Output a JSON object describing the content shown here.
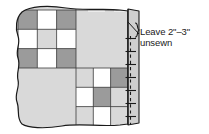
{
  "diagram": {
    "annotation": {
      "line1": "Leave 2\"–3\"",
      "line2": "unsewn",
      "brace": "}"
    },
    "colors": {
      "dark_patch": "#9b9b9b",
      "light_patch": "#d9d9d9",
      "white_patch": "#ffffff",
      "outline": "#1a1a1a",
      "seam_line": "#1a1a1a",
      "flap_fill": "#cfcfcf",
      "background": "#ffffff"
    },
    "quilt": {
      "description": "Alternating nine-patch blocks and plain blocks",
      "blocks": [
        {
          "name": "nine-patch-top-left",
          "type": "nine-patch",
          "cells": [
            "dark",
            "white",
            "dark",
            "white",
            "light",
            "white",
            "dark",
            "white",
            "dark"
          ]
        },
        {
          "name": "plain-top-right",
          "type": "plain",
          "cells": [
            "light"
          ]
        },
        {
          "name": "plain-bottom-left",
          "type": "plain",
          "cells": [
            "light"
          ]
        },
        {
          "name": "nine-patch-bottom-right",
          "type": "nine-patch",
          "cells": [
            "light",
            "white",
            "dark",
            "white",
            "dark",
            "light",
            "light",
            "white",
            "light"
          ]
        }
      ]
    },
    "edge": {
      "name": "folded-back-flap",
      "seam_style": "dashed",
      "pin_count": 7
    }
  }
}
